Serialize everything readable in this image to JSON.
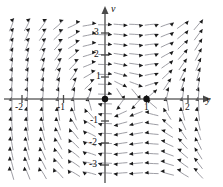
{
  "chart_data": {
    "type": "scatter",
    "title": "",
    "subtitle": "",
    "plot_kind": "direction-field",
    "xlabel": "y",
    "ylabel": "v",
    "xlim": [
      -2.45,
      2.45
    ],
    "ylim": [
      -3.7,
      3.7
    ],
    "grid": false,
    "legend": null,
    "x_tick_labels": [
      "-2",
      "-1",
      "1",
      "2"
    ],
    "x_tick_values": [
      -2,
      -1,
      1,
      2
    ],
    "y_tick_labels": [
      "3",
      "2",
      "1",
      "-1",
      "-2",
      "-3"
    ],
    "y_tick_values": [
      3,
      2,
      1,
      -1,
      -2,
      -3
    ],
    "equilibrium_points": [
      {
        "x": 0,
        "y": 0,
        "label": ""
      },
      {
        "x": 1,
        "y": 0,
        "label": ""
      }
    ],
    "annotations": []
  },
  "axes": {
    "x_label": "y",
    "y_label": "v"
  },
  "ticks": {
    "x": [
      {
        "value": -2,
        "label": "-2"
      },
      {
        "value": -1,
        "label": "-1"
      },
      {
        "value": 1,
        "label": "1"
      },
      {
        "value": 2,
        "label": "2"
      }
    ],
    "y": [
      {
        "value": 3,
        "label": "3"
      },
      {
        "value": 2,
        "label": "2"
      },
      {
        "value": 1,
        "label": "1"
      },
      {
        "value": -1,
        "label": "-1"
      },
      {
        "value": -2,
        "label": "-2"
      },
      {
        "value": -3,
        "label": "-3"
      }
    ]
  },
  "colors": {
    "axis": "#6b6b6b",
    "arrow_shaft": "#8d8d95",
    "arrow_head": "#1a1a1a",
    "equilibrium": "#121212",
    "background": "#ffffff",
    "text": "#111111"
  }
}
